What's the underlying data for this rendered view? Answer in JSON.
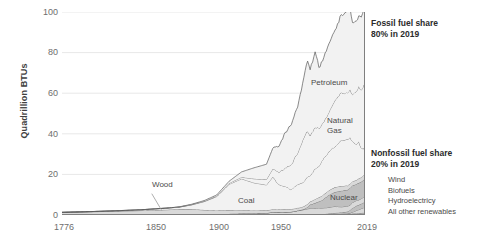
{
  "chart_data": {
    "type": "area",
    "title": "",
    "subtitle": "",
    "xlabel": "",
    "ylabel": "Quadrillion BTUs",
    "xlim": [
      1776,
      2019
    ],
    "ylim": [
      0,
      100
    ],
    "xticks": [
      "1776",
      "1850",
      "1900",
      "1950",
      "2019"
    ],
    "xtick_values": [
      1776,
      1850,
      1900,
      1950,
      2019
    ],
    "yticks": [
      "0",
      "20",
      "40",
      "60",
      "80",
      "100"
    ],
    "ytick_values": [
      0,
      20,
      40,
      60,
      80,
      100
    ],
    "grid": "horizontal",
    "legend_position": "right-inline",
    "stacked": true,
    "x": [
      1776,
      1800,
      1820,
      1840,
      1850,
      1860,
      1870,
      1880,
      1890,
      1900,
      1910,
      1920,
      1930,
      1940,
      1945,
      1950,
      1955,
      1960,
      1965,
      1970,
      1973,
      1975,
      1979,
      1982,
      1985,
      1990,
      1995,
      2000,
      2005,
      2007,
      2009,
      2012,
      2014,
      2016,
      2018,
      2019
    ],
    "series": [
      {
        "name": "Petroleum",
        "label_xy": [
          1960,
          72
        ],
        "values": [
          0,
          0,
          0,
          0,
          0,
          0,
          0.1,
          0.2,
          0.3,
          0.5,
          1.0,
          2.6,
          5.4,
          7.5,
          10.1,
          13.3,
          17.3,
          19.9,
          23.2,
          29.5,
          34.8,
          32.7,
          37.1,
          30.2,
          30.9,
          33.6,
          34.4,
          38.3,
          40.4,
          39.8,
          35.4,
          34.7,
          34.8,
          36.2,
          36.9,
          36.7
        ]
      },
      {
        "name": "Natural Gas",
        "label_xy": [
          1975,
          43
        ],
        "values": [
          0,
          0,
          0,
          0,
          0,
          0,
          0,
          0.1,
          0.2,
          0.3,
          0.5,
          0.8,
          2.0,
          2.7,
          4.0,
          6.0,
          9.0,
          12.4,
          15.8,
          21.8,
          22.5,
          19.9,
          20.7,
          18.5,
          17.8,
          19.6,
          22.7,
          23.8,
          22.6,
          23.6,
          23.4,
          26.1,
          27.5,
          28.4,
          30.9,
          32.1
        ]
      },
      {
        "name": "Coal",
        "label_xy": [
          1920,
          11
        ],
        "values": [
          0,
          0.1,
          0.2,
          0.4,
          0.6,
          0.8,
          1.0,
          2.1,
          4.1,
          6.8,
          12.7,
          15.5,
          13.6,
          12.5,
          15.9,
          12.3,
          11.2,
          9.8,
          11.6,
          12.3,
          13.3,
          12.7,
          15.0,
          15.3,
          17.5,
          19.2,
          20.1,
          22.6,
          22.8,
          22.7,
          19.7,
          17.3,
          18.0,
          14.2,
          13.2,
          11.3
        ]
      },
      {
        "name": "Wood",
        "label_xy": [
          1860,
          13
        ],
        "values": [
          1.3,
          1.6,
          1.9,
          2.2,
          2.4,
          2.6,
          2.9,
          2.9,
          2.5,
          2.0,
          1.9,
          1.6,
          1.5,
          1.4,
          1.4,
          1.4,
          1.4,
          1.3,
          1.3,
          1.4,
          1.5,
          1.5,
          1.8,
          2.0,
          2.2,
          2.2,
          2.4,
          2.3,
          2.1,
          2.1,
          2.0,
          2.0,
          2.2,
          2.2,
          2.3,
          2.3
        ]
      },
      {
        "name": "Nuclear",
        "label_xy": [
          1995,
          9
        ],
        "values": [
          0,
          0,
          0,
          0,
          0,
          0,
          0,
          0,
          0,
          0,
          0,
          0,
          0,
          0,
          0,
          0,
          0,
          0.01,
          0.04,
          0.24,
          0.91,
          1.9,
          2.7,
          3.1,
          4.1,
          6.1,
          7.1,
          7.9,
          8.1,
          8.4,
          8.4,
          8.1,
          8.3,
          8.4,
          8.4,
          8.5
        ]
      },
      {
        "name": "Hydroelectricy",
        "label_xy": [
          null,
          null
        ],
        "values": [
          0,
          0,
          0,
          0,
          0,
          0,
          0,
          0,
          0,
          0.25,
          0.54,
          0.73,
          0.75,
          0.92,
          1.4,
          1.4,
          1.4,
          1.6,
          2.1,
          2.6,
          3.0,
          3.2,
          3.1,
          3.3,
          3.0,
          3.0,
          3.2,
          2.8,
          2.7,
          2.4,
          2.7,
          2.6,
          2.5,
          2.5,
          2.7,
          2.5
        ]
      },
      {
        "name": "Biofuels",
        "label_xy": [
          null,
          null
        ],
        "values": [
          0,
          0,
          0,
          0,
          0,
          0,
          0,
          0,
          0,
          0,
          0,
          0,
          0,
          0,
          0,
          0,
          0,
          0,
          0,
          0,
          0,
          0,
          0.02,
          0.1,
          0.2,
          0.4,
          0.6,
          0.7,
          1.0,
          1.5,
          2.0,
          2.3,
          2.3,
          2.4,
          2.5,
          2.5
        ]
      },
      {
        "name": "Wind",
        "label_xy": [
          null,
          null
        ],
        "values": [
          0,
          0,
          0,
          0,
          0,
          0,
          0,
          0,
          0,
          0,
          0,
          0,
          0,
          0,
          0,
          0,
          0,
          0,
          0,
          0,
          0,
          0,
          0,
          0,
          0,
          0.03,
          0.03,
          0.06,
          0.18,
          0.34,
          0.72,
          1.34,
          1.73,
          2.1,
          2.5,
          2.7
        ]
      },
      {
        "name": "All other renewables",
        "label_xy": [
          null,
          null
        ],
        "values": [
          0,
          0,
          0,
          0,
          0,
          0,
          0,
          0,
          0,
          0,
          0,
          0,
          0,
          0,
          0,
          0,
          0,
          0,
          0,
          0.01,
          0.04,
          0.07,
          0.08,
          0.1,
          0.2,
          0.3,
          0.4,
          0.5,
          0.5,
          0.6,
          0.7,
          0.8,
          0.9,
          1.0,
          1.1,
          1.2
        ]
      }
    ],
    "total_peak": 101.0,
    "annotations": [
      {
        "id": "fossil",
        "text": "Fossil fuel share\n80% in 2019"
      },
      {
        "id": "nonfossil",
        "text": "Nonfossil fuel share\n20% in 2019"
      }
    ],
    "nonfossil_list": [
      "Wind",
      "Biofuels",
      "Hydroelectricy",
      "All other renewables"
    ],
    "inchart_labels": [
      "Petroleum",
      "Natural\nGas",
      "Coal",
      "Wood",
      "Nuclear"
    ],
    "colors": {
      "fill_light": "#f2f2f2",
      "fill_mid": "#d9d9d9",
      "fill_dark": "#bfbfbf",
      "line": "#595959",
      "grid": "#e8e8e8",
      "axis": "#808080",
      "text": "#595959",
      "text_bold": "#2b2b2b"
    }
  }
}
